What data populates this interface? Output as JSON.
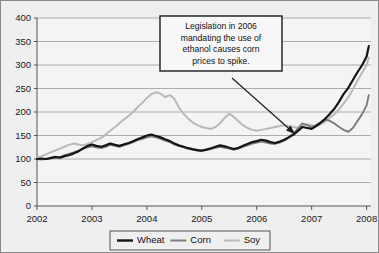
{
  "chart_data": {
    "type": "line",
    "title": "",
    "subtitle": "",
    "xlabel": "",
    "ylabel": "",
    "xlim": [
      2002,
      2008.08
    ],
    "ylim": [
      0,
      400
    ],
    "grid": true,
    "grid_axis": "y",
    "legend_position": "bottom-center",
    "xticks": [
      "2002",
      "2003",
      "2004",
      "2005",
      "2006",
      "2007",
      "2008"
    ],
    "xtick_values": [
      2002,
      2003,
      2004,
      2005,
      2006,
      2007,
      2008
    ],
    "yticks": [
      "0",
      "50",
      "100",
      "150",
      "200",
      "250",
      "300",
      "350",
      "400"
    ],
    "ytick_values": [
      0,
      50,
      100,
      150,
      200,
      250,
      300,
      350,
      400
    ],
    "annotations": [
      {
        "name": "ethanol-legislation-note",
        "lines": [
          "Legislation in 2006",
          "mandating the use of",
          "ethanol causes corn",
          "prices to spike."
        ],
        "box": {
          "x": 160,
          "y": 16,
          "width": 122,
          "height": 55
        },
        "arrow_from": {
          "x": 232,
          "y": 78
        },
        "arrow_to": {
          "x": 295,
          "y": 134
        }
      }
    ],
    "series": [
      {
        "name": "Wheat",
        "color": "#141414",
        "width": 2.2,
        "x": [
          2002.0,
          2002.08,
          2002.17,
          2002.25,
          2002.33,
          2002.42,
          2002.5,
          2002.58,
          2002.67,
          2002.75,
          2002.83,
          2002.92,
          2003.0,
          2003.08,
          2003.17,
          2003.25,
          2003.33,
          2003.42,
          2003.5,
          2003.58,
          2003.67,
          2003.75,
          2003.83,
          2003.92,
          2004.0,
          2004.08,
          2004.17,
          2004.25,
          2004.33,
          2004.42,
          2004.5,
          2004.58,
          2004.67,
          2004.75,
          2004.83,
          2004.92,
          2005.0,
          2005.08,
          2005.17,
          2005.25,
          2005.33,
          2005.42,
          2005.5,
          2005.58,
          2005.67,
          2005.75,
          2005.83,
          2005.92,
          2006.0,
          2006.08,
          2006.17,
          2006.25,
          2006.33,
          2006.42,
          2006.5,
          2006.58,
          2006.67,
          2006.75,
          2006.83,
          2006.92,
          2007.0,
          2007.08,
          2007.17,
          2007.25,
          2007.33,
          2007.42,
          2007.5,
          2007.58,
          2007.67,
          2007.75,
          2007.83,
          2007.92,
          2008.0,
          2008.04
        ],
        "values": [
          100,
          101,
          100,
          102,
          104,
          103,
          106,
          108,
          112,
          116,
          122,
          128,
          131,
          128,
          126,
          129,
          133,
          130,
          128,
          131,
          134,
          138,
          142,
          146,
          150,
          152,
          149,
          146,
          142,
          138,
          133,
          129,
          126,
          123,
          121,
          119,
          118,
          120,
          123,
          126,
          129,
          127,
          124,
          121,
          124,
          128,
          132,
          136,
          138,
          141,
          139,
          136,
          134,
          137,
          141,
          146,
          152,
          160,
          168,
          166,
          164,
          170,
          178,
          186,
          196,
          208,
          222,
          238,
          252,
          268,
          284,
          300,
          318,
          340
        ]
      },
      {
        "name": "Corn",
        "color": "#7d7d7d",
        "width": 1.9,
        "x": [
          2002.0,
          2002.08,
          2002.17,
          2002.25,
          2002.33,
          2002.42,
          2002.5,
          2002.58,
          2002.67,
          2002.75,
          2002.83,
          2002.92,
          2003.0,
          2003.08,
          2003.17,
          2003.25,
          2003.33,
          2003.42,
          2003.5,
          2003.58,
          2003.67,
          2003.75,
          2003.83,
          2003.92,
          2004.0,
          2004.08,
          2004.17,
          2004.25,
          2004.33,
          2004.42,
          2004.5,
          2004.58,
          2004.67,
          2004.75,
          2004.83,
          2004.92,
          2005.0,
          2005.08,
          2005.17,
          2005.25,
          2005.33,
          2005.42,
          2005.5,
          2005.58,
          2005.67,
          2005.75,
          2005.83,
          2005.92,
          2006.0,
          2006.08,
          2006.17,
          2006.25,
          2006.33,
          2006.42,
          2006.5,
          2006.58,
          2006.67,
          2006.75,
          2006.83,
          2006.92,
          2007.0,
          2007.08,
          2007.17,
          2007.25,
          2007.33,
          2007.42,
          2007.5,
          2007.58,
          2007.67,
          2007.75,
          2007.83,
          2007.92,
          2008.0,
          2008.04
        ],
        "values": [
          100,
          99,
          100,
          103,
          105,
          104,
          108,
          111,
          114,
          118,
          121,
          125,
          127,
          125,
          123,
          126,
          130,
          128,
          126,
          129,
          132,
          136,
          140,
          143,
          146,
          148,
          146,
          143,
          139,
          136,
          131,
          128,
          125,
          122,
          120,
          118,
          117,
          119,
          121,
          124,
          126,
          124,
          122,
          120,
          122,
          126,
          129,
          133,
          135,
          137,
          135,
          133,
          132,
          135,
          139,
          145,
          154,
          165,
          176,
          172,
          168,
          172,
          178,
          184,
          181,
          175,
          168,
          162,
          158,
          166,
          180,
          196,
          214,
          236
        ]
      },
      {
        "name": "Soy",
        "color": "#b9b9b9",
        "width": 2.0,
        "x": [
          2002.0,
          2002.08,
          2002.17,
          2002.25,
          2002.33,
          2002.42,
          2002.5,
          2002.58,
          2002.67,
          2002.75,
          2002.83,
          2002.92,
          2003.0,
          2003.08,
          2003.17,
          2003.25,
          2003.33,
          2003.42,
          2003.5,
          2003.58,
          2003.67,
          2003.75,
          2003.83,
          2003.92,
          2004.0,
          2004.08,
          2004.17,
          2004.25,
          2004.33,
          2004.42,
          2004.5,
          2004.58,
          2004.67,
          2004.75,
          2004.83,
          2004.92,
          2005.0,
          2005.08,
          2005.17,
          2005.25,
          2005.33,
          2005.42,
          2005.5,
          2005.58,
          2005.67,
          2005.75,
          2005.83,
          2005.92,
          2006.0,
          2006.08,
          2006.17,
          2006.25,
          2006.33,
          2006.42,
          2006.5,
          2006.58,
          2006.67,
          2006.75,
          2006.83,
          2006.92,
          2007.0,
          2007.08,
          2007.17,
          2007.25,
          2007.33,
          2007.42,
          2007.5,
          2007.58,
          2007.67,
          2007.75,
          2007.83,
          2007.92,
          2008.0,
          2008.04
        ],
        "values": [
          103,
          106,
          110,
          114,
          118,
          122,
          126,
          130,
          133,
          131,
          129,
          132,
          136,
          140,
          145,
          152,
          160,
          168,
          176,
          184,
          192,
          200,
          210,
          220,
          230,
          238,
          242,
          239,
          232,
          236,
          228,
          210,
          196,
          186,
          178,
          172,
          168,
          166,
          164,
          168,
          176,
          188,
          196,
          190,
          180,
          172,
          166,
          162,
          160,
          162,
          164,
          166,
          168,
          170,
          172,
          170,
          168,
          166,
          170,
          174,
          172,
          170,
          174,
          180,
          188,
          196,
          206,
          218,
          232,
          248,
          266,
          284,
          300,
          316
        ]
      }
    ]
  },
  "legend": {
    "items": [
      {
        "label": "Wheat",
        "color": "#141414"
      },
      {
        "label": "Corn",
        "color": "#7d7d7d"
      },
      {
        "label": "Soy",
        "color": "#b9b9b9"
      }
    ]
  }
}
